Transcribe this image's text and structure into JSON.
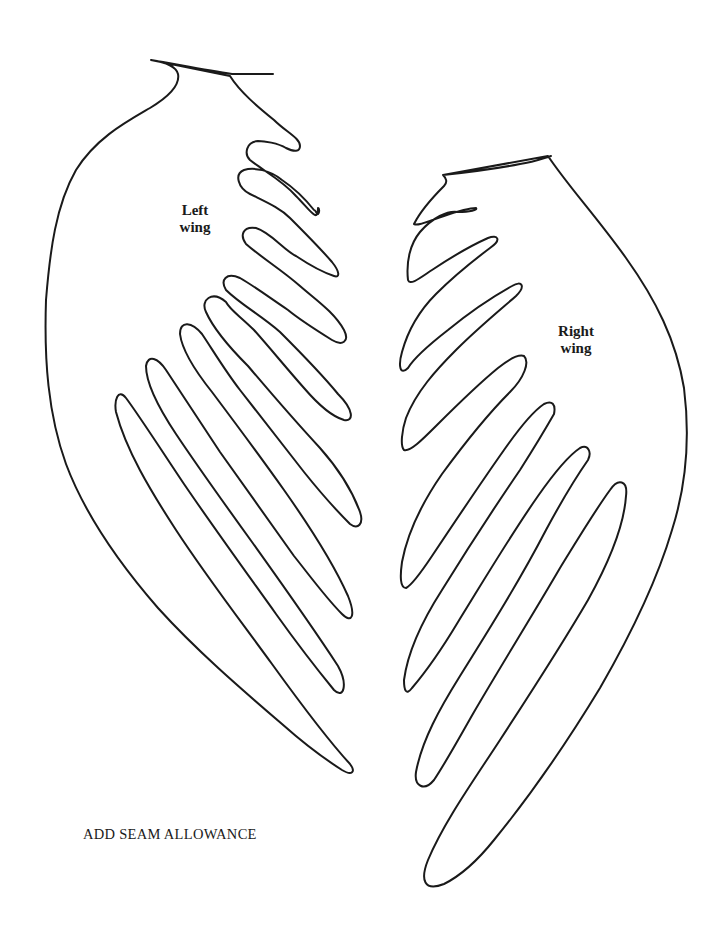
{
  "pattern": {
    "title": "Wing pattern pieces",
    "stroke_color": "#1a1a1a",
    "background_color": "#ffffff",
    "pieces": [
      {
        "id": "left",
        "label_line1": "Left",
        "label_line2": "wing",
        "feather_count": 9
      },
      {
        "id": "right",
        "label_line1": "Right",
        "label_line2": "wing",
        "feather_count": 9
      }
    ],
    "instruction": "ADD SEAM ALLOWANCE"
  }
}
